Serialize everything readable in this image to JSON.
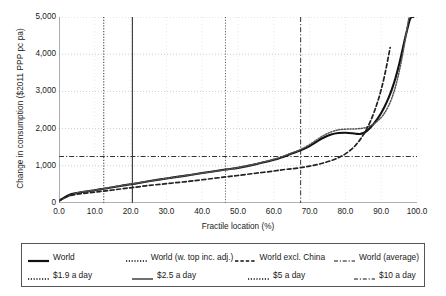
{
  "chart_data": {
    "type": "line",
    "title": "",
    "xlabel": "Fractile location (%)",
    "ylabel": "Change in consumption ($2011 PPP pc pa)",
    "xlim": [
      0,
      100
    ],
    "ylim": [
      0,
      5000
    ],
    "xticks": [
      "0.0",
      "10.0",
      "20.0",
      "30.0",
      "40.0",
      "50.0",
      "60.0",
      "70.0",
      "80.0",
      "90.0",
      "100.0"
    ],
    "xtick_values": [
      0,
      10,
      20,
      30,
      40,
      50,
      60,
      70,
      80,
      90,
      100
    ],
    "yticks": [
      "0",
      "1,000",
      "2,000",
      "3,000",
      "4,000",
      "5,000"
    ],
    "ytick_values": [
      0,
      1000,
      2000,
      3000,
      4000,
      5000
    ],
    "grid": "dotted-both",
    "legend_position": "below-plot",
    "series": [
      {
        "name": "World",
        "style": "solid",
        "width": 2.1,
        "color": "#111111",
        "x": [
          0,
          1,
          2,
          3,
          4,
          5,
          7.5,
          10,
          12.5,
          15,
          17.5,
          20.5,
          25,
          30,
          35,
          40,
          46.5,
          50,
          55,
          60,
          62,
          65,
          67.5,
          70,
          72,
          74,
          76,
          78,
          80,
          82,
          83,
          84,
          85,
          86,
          87,
          88,
          89,
          90,
          91,
          92,
          93,
          94,
          95,
          96,
          97,
          98,
          98.6,
          99
        ],
        "y": [
          60,
          120,
          180,
          225,
          250,
          270,
          310,
          345,
          385,
          425,
          465,
          510,
          585,
          660,
          730,
          805,
          900,
          945,
          1040,
          1160,
          1220,
          1330,
          1415,
          1530,
          1650,
          1760,
          1840,
          1880,
          1890,
          1875,
          1860,
          1855,
          1880,
          1940,
          2030,
          2140,
          2270,
          2420,
          2600,
          2810,
          3060,
          3360,
          3720,
          4140,
          4560,
          4930,
          5000,
          5000
        ]
      },
      {
        "name": "World (w. top inc. adj.)",
        "style": "dotted",
        "width": 1.5,
        "color": "#555555",
        "x": [
          0,
          5,
          10,
          20,
          30,
          40,
          50,
          60,
          65,
          67.5,
          70,
          72,
          74,
          76,
          78,
          80,
          82,
          84,
          86,
          88,
          90,
          91,
          92,
          93,
          94,
          95,
          96,
          97,
          97.8,
          98.3
        ],
        "y": [
          60,
          270,
          345,
          510,
          660,
          805,
          950,
          1175,
          1345,
          1440,
          1570,
          1700,
          1820,
          1910,
          1965,
          1985,
          1990,
          2000,
          2040,
          2130,
          2300,
          2430,
          2600,
          2830,
          3130,
          3520,
          4000,
          4560,
          5000,
          5000
        ]
      },
      {
        "name": "World excl. China",
        "style": "dashed",
        "width": 1.7,
        "color": "#222222",
        "x": [
          0,
          1,
          2,
          3,
          5,
          7.5,
          10,
          12.5,
          15,
          17.5,
          20.5,
          25,
          30,
          35,
          40,
          46.5,
          50,
          55,
          60,
          63,
          65,
          67.5,
          70,
          72,
          74,
          76,
          78,
          80,
          82,
          83,
          84,
          85,
          86,
          87,
          88,
          89,
          90,
          91,
          92,
          92.5
        ],
        "y": [
          55,
          115,
          165,
          200,
          235,
          265,
          295,
          320,
          350,
          380,
          415,
          470,
          520,
          570,
          625,
          700,
          740,
          800,
          860,
          900,
          920,
          950,
          990,
          1030,
          1080,
          1140,
          1215,
          1320,
          1470,
          1570,
          1690,
          1830,
          2000,
          2200,
          2440,
          2720,
          3050,
          3450,
          3930,
          4180
        ]
      },
      {
        "name": "World (average)",
        "style": "dash-dot-horizontal",
        "width": 1.0,
        "color": "#333333",
        "type": "hline",
        "y": 1250
      },
      {
        "name": "$1.9 a day",
        "style": "dotted-vertical",
        "width": 1.0,
        "color": "#333333",
        "type": "vline",
        "x": 12.5
      },
      {
        "name": "$2.5 a day",
        "style": "solid-vertical",
        "width": 1.1,
        "color": "#333333",
        "type": "vline",
        "x": 20.5
      },
      {
        "name": "$5 a day",
        "style": "dotted-vertical",
        "width": 1.0,
        "color": "#666666",
        "type": "vline",
        "x": 46.5
      },
      {
        "name": "$10 a day",
        "style": "dash-dot-vertical",
        "width": 1.0,
        "color": "#333333",
        "type": "vline",
        "x": 67.5
      }
    ]
  },
  "legend": {
    "rows": [
      [
        {
          "label": "World",
          "dash": "solid",
          "w": 2.2
        },
        {
          "label": "World (w. top inc. adj.)",
          "dash": "dotted",
          "w": 1.4
        },
        {
          "label": "World excl. China",
          "dash": "dashed",
          "w": 1.5
        },
        {
          "label": "World (average)",
          "dash": "dashdot",
          "w": 1.2
        }
      ],
      [
        {
          "label": "$1.9 a day",
          "dash": "dotted",
          "w": 1.3
        },
        {
          "label": "$2.5 a day",
          "dash": "solid",
          "w": 1.2
        },
        {
          "label": "$5 a day",
          "dash": "dotted",
          "w": 1.3
        },
        {
          "label": "$10 a day",
          "dash": "dashdot",
          "w": 1.2
        }
      ]
    ]
  }
}
